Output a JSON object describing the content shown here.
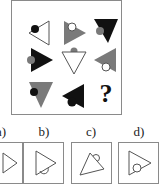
{
  "puzzle": {
    "question_mark": "?",
    "grid": [
      [
        {
          "shape": "triangle-left",
          "fill": "white",
          "circle_fill": "black",
          "circle_pos": "top-left"
        },
        {
          "shape": "triangle-right",
          "fill": "gray",
          "circle_fill": "white",
          "circle_pos": "top"
        },
        {
          "shape": "triangle-down",
          "fill": "black",
          "circle_fill": "gray",
          "circle_pos": "left"
        }
      ],
      [
        {
          "shape": "triangle-right",
          "fill": "black",
          "circle_fill": "gray",
          "circle_pos": "left"
        },
        {
          "shape": "triangle-down",
          "fill": "white",
          "circle_fill": "gray",
          "circle_pos": "top"
        },
        {
          "shape": "triangle-left",
          "fill": "gray",
          "circle_fill": "white",
          "circle_pos": "bottom"
        }
      ],
      [
        {
          "shape": "triangle-down",
          "fill": "gray",
          "circle_fill": "black",
          "circle_pos": "left"
        },
        {
          "shape": "triangle-left",
          "fill": "black",
          "circle_fill": "black",
          "circle_pos": "bottom"
        },
        {
          "shape": "unknown",
          "label": "?"
        }
      ]
    ],
    "options": [
      {
        "label": "a)"
      },
      {
        "label": "b)"
      },
      {
        "label": "c)"
      },
      {
        "label": "d)"
      }
    ],
    "colors": {
      "black": "#111111",
      "gray": "#7a7a7a",
      "white": "#ffffff",
      "border": "#8a8a8a"
    }
  }
}
